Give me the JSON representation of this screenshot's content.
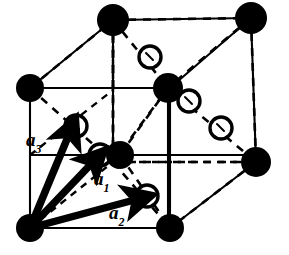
{
  "figure": {
    "colors": {
      "background": "#ffffff",
      "ink": "#000000",
      "solid_atom_fill": "#000000",
      "open_atom_fill": "#ffffff",
      "open_atom_stroke": "#000000",
      "solid_edge": "#000000",
      "hidden_edge": "#000000",
      "vector": "#000000"
    },
    "geometry": {
      "cell_type": "cubic",
      "projection": "oblique",
      "front_face": {
        "bottom_left": [
          30,
          228
        ],
        "bottom_right": [
          170,
          228
        ],
        "top_right": [
          170,
          88
        ],
        "top_left": [
          30,
          88
        ]
      },
      "back_face": {
        "bottom_left": [
          113,
          162
        ],
        "bottom_right": [
          256,
          162
        ],
        "top_right": [
          251,
          18
        ],
        "top_left": [
          113,
          20
        ]
      },
      "offset_vector": [
        83,
        -66
      ]
    },
    "vectors": [
      {
        "id": "a1",
        "label": "a",
        "subscript": "1",
        "origin": [
          30,
          228
        ],
        "tip": [
          100,
          155
        ],
        "label_pos": [
          95,
          170
        ],
        "target_site": "open-circle-front-face-centre"
      },
      {
        "id": "a2",
        "label": "a",
        "subscript": "2",
        "origin": [
          30,
          228
        ],
        "tip": [
          146,
          196
        ],
        "label_pos": [
          110,
          202
        ],
        "target_site": "open-circle-bottom-face"
      },
      {
        "id": "a3",
        "label": "a",
        "subscript": "3",
        "origin": [
          30,
          228
        ],
        "tip": [
          76,
          126
        ],
        "label_pos": [
          27,
          132
        ],
        "target_site": "open-circle-left-face"
      }
    ],
    "solid_atoms": [
      {
        "name": "corner-front-bottom-left",
        "cx": 30,
        "cy": 228,
        "r": 14
      },
      {
        "name": "corner-front-bottom-right",
        "cx": 170,
        "cy": 228,
        "r": 14
      },
      {
        "name": "corner-front-top-left",
        "cx": 30,
        "cy": 88,
        "r": 14
      },
      {
        "name": "face-centre-front",
        "cx": 120,
        "cy": 155,
        "r": 14
      },
      {
        "name": "corner-back-top-left",
        "cx": 113,
        "cy": 20,
        "r": 16
      },
      {
        "name": "corner-back-top-right",
        "cx": 251,
        "cy": 18,
        "r": 16
      },
      {
        "name": "corner-back-bottom-right",
        "cx": 256,
        "cy": 162,
        "r": 15
      },
      {
        "name": "face-centre-top",
        "cx": 168,
        "cy": 88,
        "r": 15
      }
    ],
    "open_atoms": [
      {
        "name": "open-site-upper-centre",
        "cx": 150,
        "cy": 57,
        "r": 11
      },
      {
        "name": "open-site-left-face",
        "cx": 76,
        "cy": 126,
        "r": 11
      },
      {
        "name": "open-site-right-upper",
        "cx": 189,
        "cy": 101,
        "r": 11
      },
      {
        "name": "open-site-right-lower",
        "cx": 221,
        "cy": 128,
        "r": 11
      },
      {
        "name": "open-site-front-centre",
        "cx": 100,
        "cy": 155,
        "r": 11
      },
      {
        "name": "open-site-bottom-front",
        "cx": 147,
        "cy": 196,
        "r": 11
      }
    ],
    "legend": {
      "solid_atom_meaning": "filled lattice site",
      "open_atom_meaning": "open basis site"
    }
  }
}
